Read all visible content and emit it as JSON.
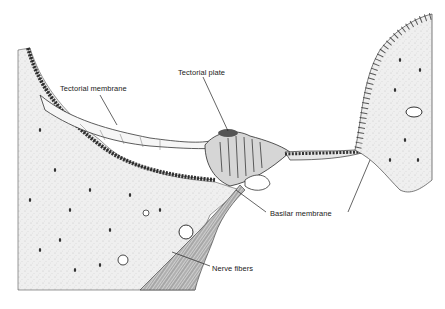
{
  "figure": {
    "style": "pen-and-ink histological illustration",
    "colors": {
      "ink": "#2a2a2a",
      "tissue_fill": "#ececec",
      "background": "#ffffff"
    },
    "labels": [
      {
        "id": "tectorial-membrane",
        "text": "Tectorial  membrane",
        "x": 60,
        "y": 84
      },
      {
        "id": "tectorial-plate",
        "text": "Tectorial plate",
        "x": 178,
        "y": 68
      },
      {
        "id": "basilar-membrane",
        "text": "Basilar membrane",
        "x": 270,
        "y": 209
      },
      {
        "id": "nerve-fibers",
        "text": "Nerve fibers",
        "x": 212,
        "y": 264
      }
    ]
  }
}
